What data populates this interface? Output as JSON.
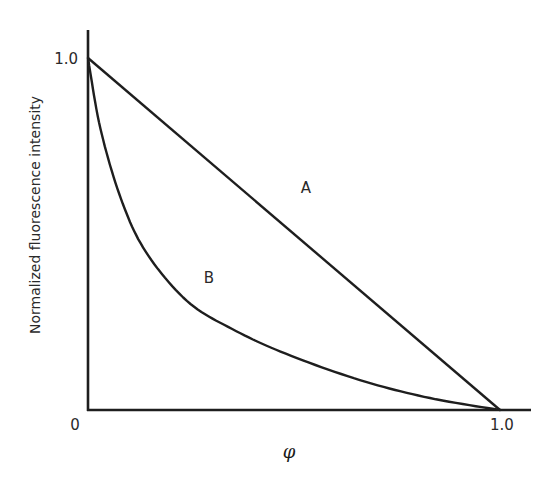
{
  "chart_data": {
    "type": "line",
    "title": "",
    "xlabel": "φ",
    "ylabel": "Normalized fluorescence intensity",
    "xlim": [
      0,
      1.0
    ],
    "ylim": [
      0,
      1.0
    ],
    "x_ticks": [
      "0",
      "1.0"
    ],
    "y_ticks": [
      "0",
      "1.0"
    ],
    "grid": false,
    "legend": null,
    "series": [
      {
        "name": "A",
        "x": [
          0,
          1.0
        ],
        "y": [
          1.0,
          0
        ]
      },
      {
        "name": "B",
        "x": [
          0,
          0.03,
          0.08,
          0.14,
          0.24,
          0.35,
          0.48,
          0.66,
          0.83,
          1.0
        ],
        "y": [
          1.0,
          0.8,
          0.6,
          0.45,
          0.31,
          0.23,
          0.16,
          0.085,
          0.034,
          0
        ]
      }
    ],
    "annotations": [
      {
        "text": "A",
        "near": "line A, midpoint"
      },
      {
        "text": "B",
        "near": "curve B, lower-left region"
      }
    ]
  },
  "labels": {
    "x_origin": "0",
    "x_max": "1.0",
    "y_max": "1.0",
    "xlabel": "φ",
    "ylabel": "Normalized fluorescence intensity",
    "curve_a": "A",
    "curve_b": "B"
  }
}
